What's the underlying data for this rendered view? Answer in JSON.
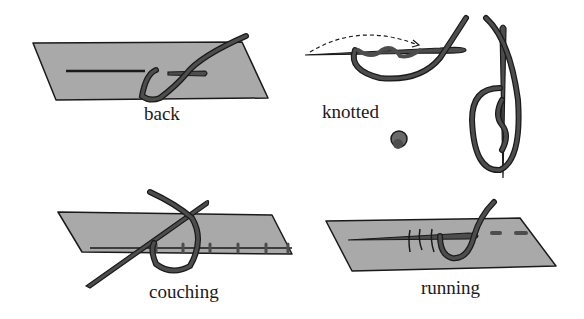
{
  "colors": {
    "fabric": "#a9a9a9",
    "thread": "#4d4d4d",
    "outline": "#1a1a1a",
    "background": "#ffffff"
  },
  "stitches": [
    {
      "id": "back",
      "label": "back"
    },
    {
      "id": "knotted",
      "label": "knotted"
    },
    {
      "id": "couching",
      "label": "couching"
    },
    {
      "id": "running",
      "label": "running"
    }
  ]
}
